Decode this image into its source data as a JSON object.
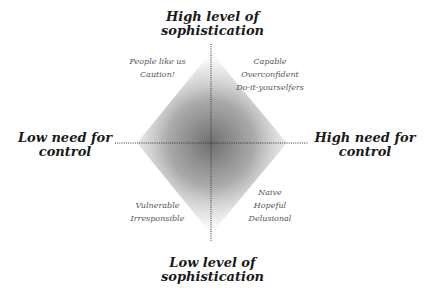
{
  "diagram": {
    "type": "quadrant-matrix",
    "axes": {
      "top": {
        "lines": [
          "High level of",
          "sophistication"
        ]
      },
      "bottom": {
        "lines": [
          "Low level of",
          "sophistication"
        ]
      },
      "left": {
        "lines": [
          "Low need for",
          "control"
        ]
      },
      "right": {
        "lines": [
          "High need for",
          "control"
        ]
      }
    },
    "quadrants": {
      "top_left": {
        "lines": [
          "People like us",
          "Caution!"
        ]
      },
      "top_right": {
        "lines": [
          "Capable",
          "Overconfident",
          "Do-it-yourselfers"
        ]
      },
      "bottom_left": {
        "lines": [
          "Vulnerable",
          "Irresponsible"
        ]
      },
      "bottom_right": {
        "lines": [
          "Naive",
          "Hopeful",
          "Delusional"
        ]
      }
    },
    "colors": {
      "center_shade": "#6e6e6e",
      "edge_shade": "#ffffff",
      "axis_line": "#333333",
      "axis_text": "#1a1a1a",
      "quadrant_text": "#555555"
    }
  }
}
